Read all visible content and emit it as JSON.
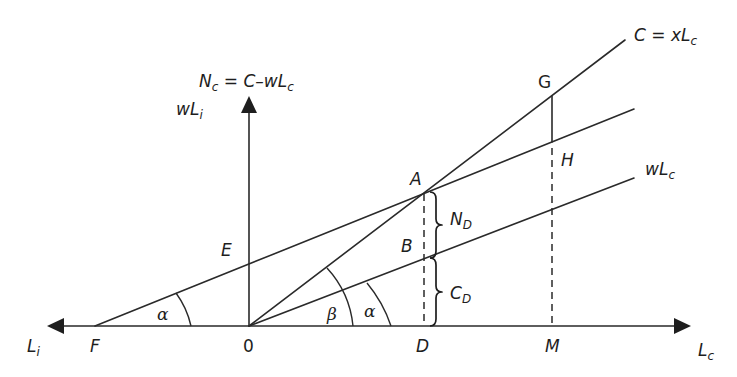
{
  "diagram": {
    "type": "geometric-economics-diagram",
    "axes": {
      "horizontal_right_label": {
        "main": "L",
        "sub": "c"
      },
      "horizontal_left_label": {
        "main": "L",
        "sub": "i"
      },
      "vertical_label": {
        "main": "N",
        "sub": "c",
        "rest": " = C–wL",
        "rest_sub": "c"
      },
      "vertical_secondary_label": {
        "main": "wL",
        "sub": "i"
      }
    },
    "lines": {
      "consumption": {
        "main": "C = xL",
        "sub": "c"
      },
      "wage_c": {
        "main": "wL",
        "sub": "c"
      }
    },
    "points": {
      "origin": "0",
      "F": "F",
      "E": "E",
      "A": "A",
      "B": "B",
      "D": "D",
      "G": "G",
      "H": "H",
      "M": "M"
    },
    "segments": {
      "upper_bracket": {
        "main": "N",
        "sub": "D"
      },
      "lower_bracket": {
        "main": "C",
        "sub": "D"
      }
    },
    "angles": {
      "alpha_at_F": "α",
      "beta_at_O": "β",
      "alpha_at_O": "α"
    },
    "colors": {
      "ink": "#2a2a2a",
      "background": "#ffffff"
    }
  }
}
